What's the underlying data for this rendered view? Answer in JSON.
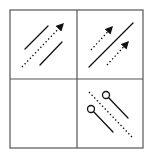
{
  "diagram": {
    "type": "2x2 grid of line/arrow glyph panels",
    "grid": {
      "left": 10,
      "top": 10,
      "right": 143,
      "bottom": 148,
      "mid_x": 77,
      "mid_y": 79,
      "line_color": "#555555",
      "line_width": 1.2
    },
    "stroke_color": "#111111",
    "panels": [
      {
        "id": "top-left",
        "description": "two parallel solid lines with a dotted arrow between them pointing up-right",
        "elements": [
          {
            "kind": "solid-line",
            "x1": 25,
            "y1": 49,
            "x2": 48,
            "y2": 26
          },
          {
            "kind": "dotted-arrow",
            "x1": 22,
            "y1": 67,
            "x2": 64,
            "y2": 23
          },
          {
            "kind": "solid-line",
            "x1": 40,
            "y1": 65,
            "x2": 62,
            "y2": 42
          }
        ]
      },
      {
        "id": "top-right",
        "description": "one solid line with two dotted arrows on either side pointing up-right",
        "elements": [
          {
            "kind": "dotted-arrow",
            "x1": 91,
            "y1": 50,
            "x2": 113,
            "y2": 26
          },
          {
            "kind": "solid-line",
            "x1": 89,
            "y1": 67,
            "x2": 133,
            "y2": 23
          },
          {
            "kind": "dotted-arrow",
            "x1": 107,
            "y1": 65,
            "x2": 129,
            "y2": 41
          }
        ]
      },
      {
        "id": "bottom-left",
        "description": "empty panel",
        "elements": []
      },
      {
        "id": "bottom-right",
        "description": "dotted line with two solid lines each starting from an open circle, running down-right",
        "elements": [
          {
            "kind": "dotted-line",
            "x1": 89,
            "y1": 92,
            "x2": 132,
            "y2": 137
          },
          {
            "kind": "circle-line",
            "cx": 106,
            "cy": 95,
            "r": 3.5,
            "x2": 128,
            "y2": 118
          },
          {
            "kind": "circle-line",
            "cx": 91,
            "cy": 109,
            "r": 3.5,
            "x2": 113,
            "y2": 132
          }
        ]
      }
    ]
  }
}
